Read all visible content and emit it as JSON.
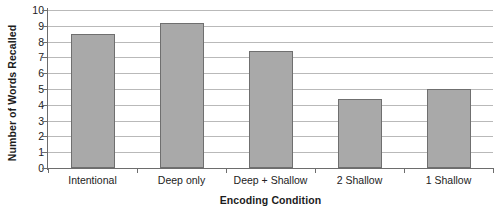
{
  "chart_data": {
    "type": "bar",
    "title": "",
    "xlabel": "Encoding Condition",
    "ylabel": "Number of Words Recalled",
    "categories": [
      "Intentional",
      "Deep only",
      "Deep + Shallow",
      "2 Shallow",
      "1 Shallow"
    ],
    "values": [
      8.5,
      9.2,
      7.4,
      4.35,
      5.0
    ],
    "ylim": [
      0,
      10
    ],
    "ytick_labels": [
      "0",
      "1",
      "2",
      "3",
      "4",
      "5",
      "6",
      "7",
      "8",
      "9",
      "10"
    ],
    "ytick_values": [
      0,
      1,
      2,
      3,
      4,
      5,
      6,
      7,
      8,
      9,
      10
    ],
    "grid": true,
    "legend": false,
    "series": [
      {
        "name": "Words Recalled",
        "values": [
          8.5,
          9.2,
          7.4,
          4.35,
          5.0
        ],
        "color": "#a9a9a9",
        "border_color": "#6f6f6f"
      }
    ],
    "colors": {
      "bar_fill": "#a9a9a9",
      "bar_border": "#6f6f6f",
      "gridline": "#b9b9b9",
      "axis": "#6d6d6d",
      "text": "#222222",
      "background": "#ffffff"
    }
  }
}
